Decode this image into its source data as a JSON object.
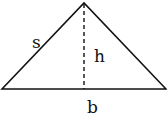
{
  "diagram": {
    "shape": "isosceles-triangle",
    "labels": {
      "side": "s",
      "height": "h",
      "base": "b"
    },
    "colors": {
      "stroke": "#111111",
      "background": "#ffffff"
    }
  }
}
